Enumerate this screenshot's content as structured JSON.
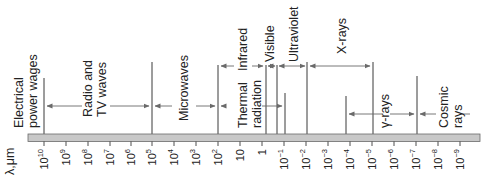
{
  "axis": {
    "unit_label": "λ,μm",
    "ticks": [
      {
        "base": "10",
        "exp": "10",
        "x": 44
      },
      {
        "base": "10",
        "exp": "9",
        "x": 66
      },
      {
        "base": "10",
        "exp": "8",
        "x": 88
      },
      {
        "base": "10",
        "exp": "7",
        "x": 110
      },
      {
        "base": "10",
        "exp": "6",
        "x": 131
      },
      {
        "base": "10",
        "exp": "5",
        "x": 152
      },
      {
        "base": "10",
        "exp": "4",
        "x": 174
      },
      {
        "base": "10",
        "exp": "3",
        "x": 196
      },
      {
        "base": "10",
        "exp": "2",
        "x": 218
      },
      {
        "base": "10",
        "exp": "",
        "x": 240
      },
      {
        "base": "1",
        "exp": "",
        "x": 262
      },
      {
        "base": "10",
        "exp": "−1",
        "x": 284
      },
      {
        "base": "10",
        "exp": "−2",
        "x": 306
      },
      {
        "base": "10",
        "exp": "−3",
        "x": 328
      },
      {
        "base": "10",
        "exp": "−4",
        "x": 350
      },
      {
        "base": "10",
        "exp": "−5",
        "x": 372
      },
      {
        "base": "10",
        "exp": "−6",
        "x": 394
      },
      {
        "base": "10",
        "exp": "−7",
        "x": 416
      },
      {
        "base": "10",
        "exp": "−8",
        "x": 438
      },
      {
        "base": "10",
        "exp": "−9",
        "x": 460
      }
    ]
  },
  "bands": [
    {
      "name": "electrical-power-waves",
      "lines": [
        "Electrical",
        "power wages"
      ]
    },
    {
      "name": "radio-tv-waves",
      "lines": [
        "Radio and",
        "TV waves"
      ]
    },
    {
      "name": "microwaves",
      "lines": [
        "Microwaves"
      ]
    },
    {
      "name": "thermal-radiation",
      "lines": [
        "Thermal",
        "radiation"
      ]
    },
    {
      "name": "infrared",
      "lines": [
        "Infrared"
      ]
    },
    {
      "name": "visible",
      "lines": [
        "Visible"
      ]
    },
    {
      "name": "ultraviolet",
      "lines": [
        "Ultraviolet"
      ]
    },
    {
      "name": "x-rays",
      "lines": [
        "X-rays"
      ]
    },
    {
      "name": "gamma-rays",
      "lines": [
        "γ-rays"
      ]
    },
    {
      "name": "cosmic-rays",
      "lines": [
        "Cosmic",
        "rays"
      ]
    }
  ],
  "colors": {
    "bar_fill": "#c8c8c8",
    "bar_stroke": "#6a6a6a",
    "line": "#3a3a3a",
    "arrow": "#6a6a6a"
  }
}
